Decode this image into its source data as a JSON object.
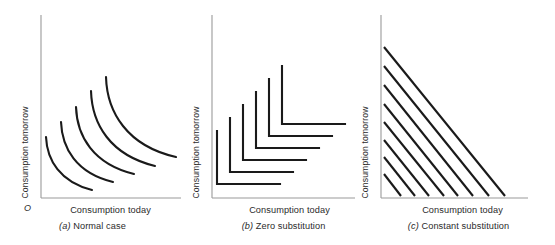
{
  "figure": {
    "background_color": "#ffffff",
    "axis_color": "#9a9a9a",
    "curve_color": "#1a1a1a",
    "origin_label": "O",
    "shared": {
      "xlabel": "Consumption today",
      "ylabel": "Consumption tomorrow"
    }
  },
  "panels": [
    {
      "key": "a",
      "tag": "(a)",
      "title": "Normal case",
      "xlabel": "Consumption today",
      "ylabel": "Consumption tomorrow",
      "origin_label": "O",
      "curve_count": 5,
      "curve_kind": "convex"
    },
    {
      "key": "b",
      "tag": "(b)",
      "title": "Zero substitution",
      "xlabel": "Consumption today",
      "ylabel": "Consumption tomorrow",
      "origin_label": "",
      "curve_count": 6,
      "curve_kind": "l-shaped"
    },
    {
      "key": "c",
      "tag": "(c)",
      "title": "Constant substitution",
      "xlabel": "Consumption today",
      "ylabel": "Consumption tomorrow",
      "origin_label": "",
      "curve_count": 8,
      "curve_kind": "straight-line"
    }
  ],
  "chart_data": [
    {
      "type": "line",
      "panel": "a",
      "title": "Normal case",
      "xlabel": "Consumption today",
      "ylabel": "Consumption tomorrow",
      "grid": false,
      "legend": "none",
      "axis_ticks": [],
      "xlim": [
        0,
        100
      ],
      "ylim": [
        0,
        100
      ],
      "description": "Five nested convex indifference curves, each bowed toward the origin, rising utility moving outward from the origin.",
      "series": [
        {
          "name": "IC1",
          "x": [
            4,
            7,
            13,
            22,
            33,
            44,
            53
          ],
          "y": [
            62,
            46,
            30,
            19,
            12,
            8,
            6
          ]
        },
        {
          "name": "IC2",
          "x": [
            17,
            20,
            26,
            36,
            47,
            59,
            69
          ],
          "y": [
            76,
            59,
            42,
            29,
            20,
            14,
            11
          ]
        },
        {
          "name": "IC3",
          "x": [
            31,
            34,
            40,
            50,
            62,
            74,
            85
          ],
          "y": [
            86,
            70,
            52,
            38,
            28,
            21,
            17
          ]
        },
        {
          "name": "IC4",
          "x": [
            45,
            48,
            55,
            65,
            77,
            89,
            100
          ],
          "y": [
            93,
            78,
            61,
            46,
            35,
            28,
            23
          ]
        },
        {
          "name": "IC5",
          "x": [
            59,
            62,
            69,
            80,
            92,
            104,
            116
          ],
          "y": [
            100,
            86,
            70,
            55,
            44,
            36,
            31
          ]
        }
      ]
    },
    {
      "type": "line",
      "panel": "b",
      "title": "Zero substitution",
      "xlabel": "Consumption today",
      "ylabel": "Consumption tomorrow",
      "grid": false,
      "legend": "none",
      "axis_ticks": [],
      "xlim": [
        0,
        100
      ],
      "ylim": [
        0,
        100
      ],
      "description": "Six L-shaped (Leontief, perfect-complements) indifference curves; corners lie along a 45-degree ray from the origin.",
      "series": [
        {
          "name": "IC1",
          "corner_x": 6,
          "corner_y": 9,
          "x": [
            6,
            6,
            62
          ],
          "y": [
            56,
            9,
            9
          ]
        },
        {
          "name": "IC2",
          "corner_x": 16,
          "corner_y": 19,
          "x": [
            16,
            16,
            72
          ],
          "y": [
            66,
            19,
            19
          ]
        },
        {
          "name": "IC3",
          "corner_x": 26,
          "corner_y": 29,
          "x": [
            26,
            26,
            82
          ],
          "y": [
            76,
            29,
            29
          ]
        },
        {
          "name": "IC4",
          "corner_x": 36,
          "corner_y": 39,
          "x": [
            36,
            36,
            92
          ],
          "y": [
            86,
            39,
            39
          ]
        },
        {
          "name": "IC5",
          "corner_x": 46,
          "corner_y": 49,
          "x": [
            46,
            46,
            102
          ],
          "y": [
            96,
            49,
            49
          ]
        },
        {
          "name": "IC6",
          "corner_x": 56,
          "corner_y": 59,
          "x": [
            56,
            56,
            112
          ],
          "y": [
            106,
            59,
            59
          ]
        }
      ]
    },
    {
      "type": "line",
      "panel": "c",
      "title": "Constant substitution",
      "xlabel": "Consumption today",
      "ylabel": "Consumption tomorrow",
      "grid": false,
      "legend": "none",
      "axis_ticks": [],
      "xlim": [
        0,
        100
      ],
      "ylim": [
        0,
        100
      ],
      "slope": -1,
      "description": "Eight parallel straight-line indifference curves of constant negative slope (perfect substitutes), utility rising to the north-east.",
      "series": [
        {
          "name": "IC1",
          "x": [
            1,
            13
          ],
          "y": [
            13,
            0
          ]
        },
        {
          "name": "IC2",
          "x": [
            1,
            25
          ],
          "y": [
            25,
            0
          ]
        },
        {
          "name": "IC3",
          "x": [
            1,
            37
          ],
          "y": [
            37,
            0
          ]
        },
        {
          "name": "IC4",
          "x": [
            1,
            49
          ],
          "y": [
            49,
            0
          ]
        },
        {
          "name": "IC5",
          "x": [
            1,
            61
          ],
          "y": [
            61,
            0
          ]
        },
        {
          "name": "IC6",
          "x": [
            1,
            73
          ],
          "y": [
            73,
            0
          ]
        },
        {
          "name": "IC7",
          "x": [
            1,
            85
          ],
          "y": [
            85,
            0
          ]
        },
        {
          "name": "IC8",
          "x": [
            1,
            97
          ],
          "y": [
            97,
            0
          ]
        }
      ]
    }
  ]
}
